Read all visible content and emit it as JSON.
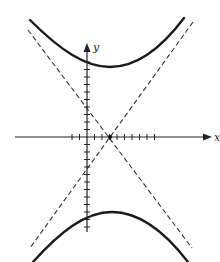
{
  "diagram": {
    "type": "hyperbola-graph",
    "axes": {
      "x_label": "x",
      "y_label": "y",
      "origin_px": [
        87,
        137
      ],
      "tick_spacing_px": 7.5,
      "x_ticks_left": 2,
      "x_ticks_right": 16,
      "y_ticks_up": 12,
      "y_ticks_down": 12
    },
    "center_px": [
      110,
      137
    ],
    "colors": {
      "curve": "#1a1a1a",
      "axis": "#222222",
      "asymptote": "#333333",
      "background": "#ffffff"
    },
    "curve_style": "solid",
    "asymptote_style": "dashed",
    "branches": [
      "upper",
      "lower"
    ],
    "asymptotes": 2
  }
}
